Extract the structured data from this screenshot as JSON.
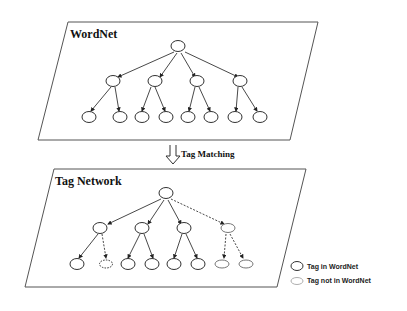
{
  "diagram": {
    "top_panel": {
      "title": "WordNet"
    },
    "arrow": {
      "label": "Tag Matching"
    },
    "bottom_panel": {
      "title": "Tag Network"
    },
    "legend": [
      {
        "label": "Tag in WordNet",
        "style": "solid"
      },
      {
        "label": "Tag not in WordNet",
        "style": "dotted"
      }
    ],
    "colors": {
      "stroke": "#333333",
      "faint": "#999999",
      "background": "#ffffff"
    }
  }
}
